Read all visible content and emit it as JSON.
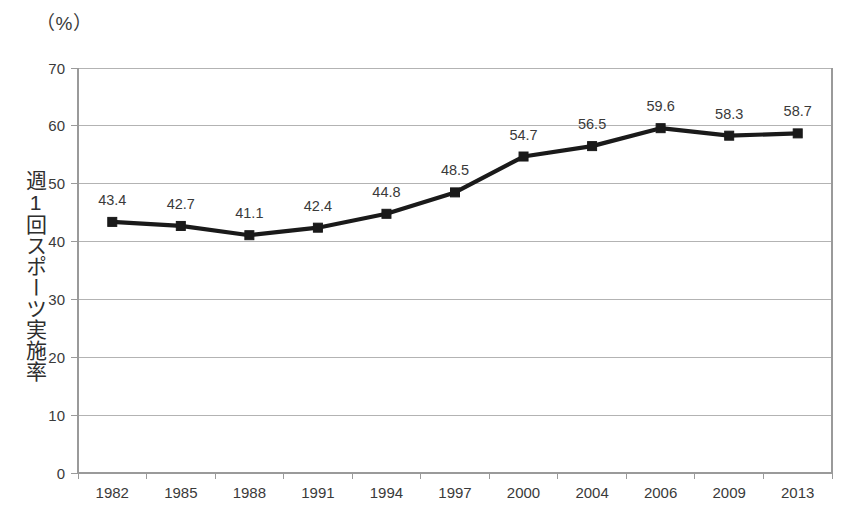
{
  "chart_data": {
    "type": "line",
    "title": "",
    "unit_label": "（%）",
    "ylabel": "週1回スポーツ実施率",
    "xlabel": "",
    "categories": [
      "1982",
      "1985",
      "1988",
      "1991",
      "1994",
      "1997",
      "2000",
      "2004",
      "2006",
      "2009",
      "2013"
    ],
    "values": [
      43.4,
      42.7,
      41.1,
      42.4,
      44.8,
      48.5,
      54.7,
      56.5,
      59.6,
      58.3,
      58.7
    ],
    "data_labels": [
      "43.4",
      "42.7",
      "41.1",
      "42.4",
      "44.8",
      "48.5",
      "54.7",
      "56.5",
      "59.6",
      "58.3",
      "58.7"
    ],
    "ylim": [
      0,
      70
    ],
    "yticks": [
      0,
      10,
      20,
      30,
      40,
      50,
      60,
      70
    ],
    "ytick_labels": [
      "0",
      "10",
      "20",
      "30",
      "40",
      "50",
      "60",
      "70"
    ],
    "grid": true,
    "legend": "none",
    "series": [
      {
        "name": "週1回スポーツ実施率",
        "values": [
          43.4,
          42.7,
          41.1,
          42.4,
          44.8,
          48.5,
          54.7,
          56.5,
          59.6,
          58.3,
          58.7
        ],
        "marker": "square",
        "line_color": "#1a1a1a",
        "marker_color": "#1a1a1a"
      }
    ],
    "colors": {
      "line": "#1a1a1a",
      "marker": "#1a1a1a",
      "grid": "#b3b3b3",
      "axis": "#9a9a9a",
      "text": "#3a3a3a",
      "background": "#ffffff"
    }
  }
}
